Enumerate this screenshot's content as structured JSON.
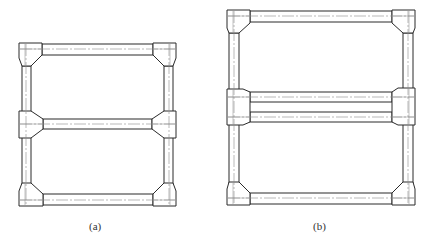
{
  "figure": {
    "panels": [
      {
        "id": "a",
        "caption": "(a)",
        "description": "Two-bay frame with haunched corner and tee joints, single middle beam"
      },
      {
        "id": "b",
        "caption": "(b)",
        "description": "Two-bay frame with haunched corners and a double (twin) middle beam"
      }
    ],
    "colors": {
      "line": "#2a2a2a",
      "centerline": "#8a8a8a",
      "background": "#ffffff"
    }
  }
}
